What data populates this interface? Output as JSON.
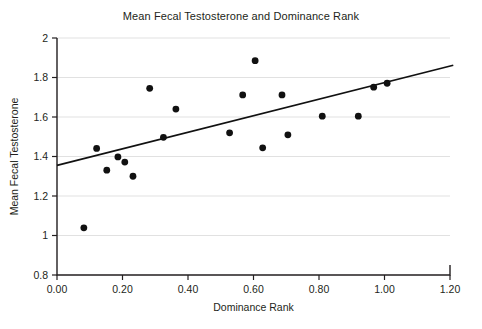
{
  "chart_data": {
    "type": "scatter",
    "title": "Mean Fecal Testosterone and Dominance Rank",
    "xlabel": "Dominance Rank",
    "ylabel": "Mean Fecal Testosterone",
    "xlim": [
      0.0,
      1.2
    ],
    "ylim": [
      0.8,
      2.0
    ],
    "xticks": [
      0.0,
      0.2,
      0.4,
      0.6,
      0.8,
      1.0,
      1.2
    ],
    "xtick_labels": [
      "0.00",
      "0.20",
      "0.40",
      "0.60",
      "0.80",
      "1.00",
      "1.20"
    ],
    "yticks": [
      0.8,
      1.0,
      1.2,
      1.4,
      1.6,
      1.8,
      2.0
    ],
    "ytick_labels": [
      "0.8",
      "1",
      "1.2",
      "1.4",
      "1.6",
      "1.8",
      "2"
    ],
    "grid": "horizontal",
    "legend": null,
    "point_color": "#111111",
    "line_color": "#111111",
    "grid_color": "#d9d9d9",
    "axis_color": "#231f20",
    "points": [
      {
        "x": 0.082,
        "y": 1.039
      },
      {
        "x": 0.121,
        "y": 1.441
      },
      {
        "x": 0.152,
        "y": 1.331
      },
      {
        "x": 0.186,
        "y": 1.398
      },
      {
        "x": 0.207,
        "y": 1.372
      },
      {
        "x": 0.232,
        "y": 1.3
      },
      {
        "x": 0.283,
        "y": 1.745
      },
      {
        "x": 0.325,
        "y": 1.497
      },
      {
        "x": 0.363,
        "y": 1.64
      },
      {
        "x": 0.527,
        "y": 1.52
      },
      {
        "x": 0.567,
        "y": 1.712
      },
      {
        "x": 0.605,
        "y": 1.885
      },
      {
        "x": 0.628,
        "y": 1.444
      },
      {
        "x": 0.687,
        "y": 1.712
      },
      {
        "x": 0.705,
        "y": 1.51
      },
      {
        "x": 0.81,
        "y": 1.604
      },
      {
        "x": 0.92,
        "y": 1.604
      },
      {
        "x": 0.967,
        "y": 1.751
      },
      {
        "x": 1.008,
        "y": 1.771
      }
    ],
    "trend_line": {
      "x0": 0.0,
      "y0": 1.355,
      "x1": 1.21,
      "y1": 1.862
    }
  }
}
